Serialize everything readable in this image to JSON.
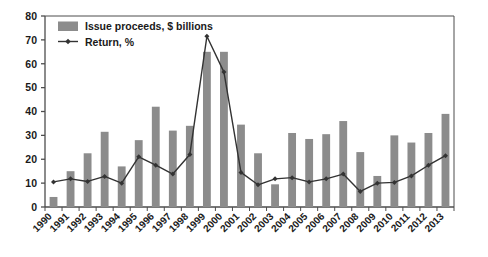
{
  "chart_data": {
    "type": "bar",
    "title": "",
    "subtitle": "",
    "xlabel": "",
    "ylabel": "",
    "ylim": [
      0,
      80
    ],
    "yticks": [
      0,
      10,
      20,
      30,
      40,
      50,
      60,
      70,
      80
    ],
    "grid": false,
    "legend_position": "top-left",
    "categories": [
      "1990",
      "1991",
      "1992",
      "1993",
      "1994",
      "1995",
      "1996",
      "1997",
      "1998",
      "1999",
      "2000",
      "2001",
      "2002",
      "2003",
      "2004",
      "2005",
      "2006",
      "2007",
      "2008",
      "2009",
      "2010",
      "2011",
      "2012",
      "2013"
    ],
    "series": [
      {
        "name": "Issue proceeds, $ billions",
        "type": "bar",
        "color": "#8c8c8c",
        "values": [
          4.2,
          15.0,
          22.5,
          31.5,
          17.0,
          28.0,
          42.0,
          32.0,
          34.0,
          65.0,
          65.0,
          34.5,
          22.5,
          9.5,
          31.0,
          28.5,
          30.5,
          36.0,
          23.0,
          13.0,
          30.0,
          27.0,
          31.0,
          39.0
        ]
      },
      {
        "name": "Return, %",
        "type": "line",
        "color": "#333333",
        "marker": "diamond",
        "values": [
          10.5,
          11.8,
          10.7,
          12.8,
          10.0,
          21.0,
          17.5,
          13.8,
          22.0,
          71.5,
          56.5,
          14.5,
          9.3,
          11.8,
          12.3,
          10.5,
          11.8,
          13.8,
          6.5,
          10.0,
          10.3,
          13.0,
          17.5,
          21.5
        ]
      }
    ]
  },
  "legend": {
    "items": [
      {
        "label": "Issue proceeds, $ billions",
        "marker": "bar-swatch"
      },
      {
        "label": "Return, %",
        "marker": "line-diamond"
      }
    ]
  },
  "colors": {
    "bar": "#8c8c8c",
    "line": "#333333",
    "axis": "#4d4d4d",
    "text": "#1a1a1a",
    "background": "#ffffff"
  }
}
